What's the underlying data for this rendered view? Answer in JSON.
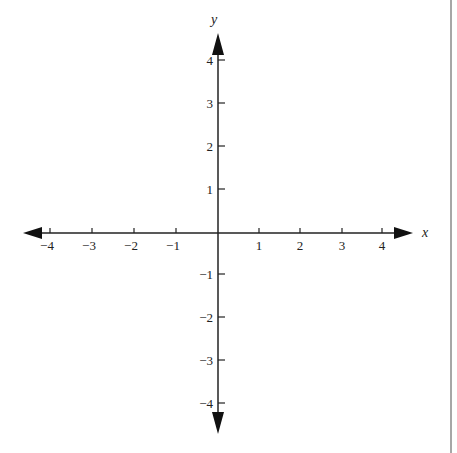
{
  "diagram": {
    "type": "cartesian-coordinate-plane",
    "x_axis": {
      "label": "x",
      "ticks": [
        -4,
        -3,
        -2,
        -1,
        1,
        2,
        3,
        4
      ],
      "tick_labels": [
        "−4",
        "−3",
        "−2",
        "−1",
        "1",
        "2",
        "3",
        "4"
      ],
      "range": [
        -4,
        4
      ]
    },
    "y_axis": {
      "label": "y",
      "ticks": [
        4,
        3,
        2,
        1,
        -1,
        -2,
        -3,
        -4
      ],
      "tick_labels": [
        "4",
        "3",
        "2",
        "1",
        "−1",
        "−2",
        "−3",
        "−4"
      ],
      "range": [
        -4,
        4
      ]
    },
    "colors": {
      "axis": "#222222",
      "background": "#ffffff",
      "border": "#888888"
    }
  }
}
